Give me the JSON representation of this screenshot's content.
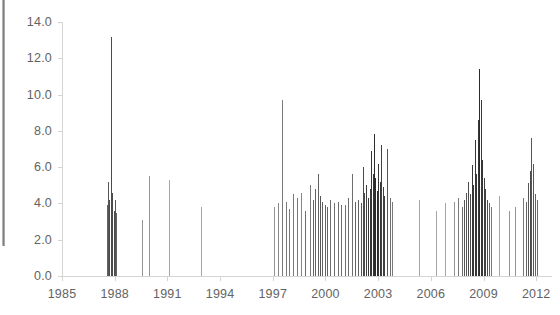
{
  "chart_data": {
    "type": "bar",
    "title": "",
    "subtitle": "",
    "xlabel": "",
    "ylabel": "",
    "xlim": [
      1985,
      2012.9
    ],
    "ylim": [
      0,
      14
    ],
    "grid": false,
    "legend": null,
    "y_ticks": [
      "0.0",
      "2.0",
      "4.0",
      "6.0",
      "8.0",
      "10.0",
      "12.0",
      "14.0"
    ],
    "y_tick_values": [
      0,
      2,
      4,
      6,
      8,
      10,
      12,
      14
    ],
    "x_ticks": [
      "1985",
      "1988",
      "1991",
      "1994",
      "1997",
      "2000",
      "2003",
      "2006",
      "2009",
      "2012"
    ],
    "x_tick_values": [
      1985,
      1988,
      1991,
      1994,
      1997,
      2000,
      2003,
      2006,
      2009,
      2012
    ],
    "x": [
      1987.55,
      1987.62,
      1987.7,
      1987.78,
      1987.86,
      1987.94,
      1988.02,
      1988.1,
      1989.55,
      1989.95,
      1991.1,
      1992.9,
      1997.05,
      1997.3,
      1997.55,
      1997.75,
      1997.95,
      1998.15,
      1998.4,
      1998.62,
      1998.85,
      1999.1,
      1999.28,
      1999.42,
      1999.55,
      1999.68,
      1999.82,
      1999.95,
      2000.1,
      2000.28,
      2000.48,
      2000.7,
      2000.9,
      2001.1,
      2001.3,
      2001.5,
      2001.68,
      2001.86,
      2002.02,
      2002.12,
      2002.22,
      2002.32,
      2002.42,
      2002.52,
      2002.6,
      2002.68,
      2002.76,
      2002.84,
      2002.92,
      2003.0,
      2003.08,
      2003.16,
      2003.26,
      2003.36,
      2003.5,
      2003.65,
      2003.8,
      2005.3,
      2006.3,
      2006.8,
      2007.3,
      2007.55,
      2007.75,
      2007.9,
      2008.02,
      2008.12,
      2008.22,
      2008.32,
      2008.42,
      2008.52,
      2008.6,
      2008.68,
      2008.76,
      2008.84,
      2008.92,
      2009.0,
      2009.08,
      2009.18,
      2009.3,
      2009.45,
      2009.9,
      2010.45,
      2010.8,
      2011.25,
      2011.4,
      2011.52,
      2011.62,
      2011.72,
      2011.82,
      2011.92,
      2012.05
    ],
    "values": [
      3.9,
      5.2,
      4.2,
      13.2,
      4.6,
      3.6,
      4.2,
      3.5,
      3.1,
      5.5,
      5.3,
      3.8,
      3.8,
      4.0,
      9.7,
      4.1,
      3.7,
      4.5,
      4.3,
      4.6,
      3.6,
      5.0,
      4.2,
      4.8,
      5.6,
      4.4,
      4.1,
      3.9,
      3.8,
      4.2,
      4.0,
      4.1,
      3.9,
      3.9,
      4.3,
      5.6,
      4.1,
      4.2,
      4.0,
      6.0,
      4.6,
      5.0,
      4.3,
      4.8,
      6.9,
      5.6,
      7.8,
      5.4,
      4.7,
      6.2,
      5.2,
      7.2,
      4.9,
      4.4,
      7.0,
      4.3,
      4.1,
      4.2,
      3.6,
      4.0,
      4.1,
      4.3,
      3.8,
      4.2,
      4.6,
      5.2,
      4.5,
      6.1,
      5.0,
      7.5,
      5.6,
      8.6,
      11.4,
      9.7,
      6.4,
      5.4,
      4.8,
      4.2,
      4.0,
      3.8,
      4.4,
      3.6,
      3.8,
      4.3,
      4.1,
      5.1,
      5.8,
      7.6,
      6.2,
      4.5,
      4.2
    ]
  },
  "axis_style": {
    "axis_line_color": "#d4d4d4",
    "tick_color": "#d4d4d4",
    "spike_color_light": "#a6a6a6",
    "spike_color_dark": "#2b2b2b",
    "label_color": "#636363"
  }
}
